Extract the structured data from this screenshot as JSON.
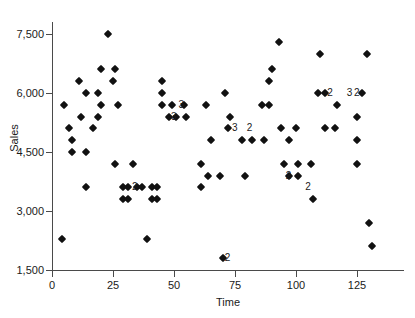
{
  "chart_data": {
    "type": "scatter",
    "title": "",
    "xlabel": "Time",
    "ylabel": "Sales",
    "xlim": [
      0,
      140
    ],
    "ylim": [
      1500,
      7800
    ],
    "grid": false,
    "legend": null,
    "xticks": [
      0,
      25,
      50,
      75,
      100,
      125
    ],
    "xticklabels": [
      "0",
      "25",
      "50",
      "75",
      "100",
      "125"
    ],
    "yticks": [
      1500,
      3000,
      4500,
      6000,
      7500
    ],
    "yticklabels": [
      "1,500",
      "3,000",
      "4,500",
      "6,000",
      "7,500"
    ],
    "marker": "diamond",
    "marker_color": "#111111",
    "points": [
      {
        "x": 4,
        "y": 2300
      },
      {
        "x": 5,
        "y": 5700
      },
      {
        "x": 7,
        "y": 5100
      },
      {
        "x": 8,
        "y": 4800
      },
      {
        "x": 8,
        "y": 4500
      },
      {
        "x": 11,
        "y": 6300
      },
      {
        "x": 12,
        "y": 5400
      },
      {
        "x": 14,
        "y": 6000
      },
      {
        "x": 14,
        "y": 4500
      },
      {
        "x": 14,
        "y": 3600
      },
      {
        "x": 17,
        "y": 5100
      },
      {
        "x": 19,
        "y": 6000
      },
      {
        "x": 19,
        "y": 5400
      },
      {
        "x": 20,
        "y": 6600
      },
      {
        "x": 20,
        "y": 5700
      },
      {
        "x": 23,
        "y": 7500
      },
      {
        "x": 25,
        "y": 6300
      },
      {
        "x": 26,
        "y": 6600
      },
      {
        "x": 26,
        "y": 4200
      },
      {
        "x": 27,
        "y": 5700
      },
      {
        "x": 29,
        "y": 3600
      },
      {
        "x": 29,
        "y": 3300
      },
      {
        "x": 31,
        "y": 3600
      },
      {
        "x": 31,
        "y": 3300
      },
      {
        "x": 33,
        "y": 4200
      },
      {
        "x": 35,
        "y": 3600
      },
      {
        "x": 37,
        "y": 3600
      },
      {
        "x": 39,
        "y": 2300
      },
      {
        "x": 41,
        "y": 3600
      },
      {
        "x": 41,
        "y": 3300
      },
      {
        "x": 43,
        "y": 3600
      },
      {
        "x": 43,
        "y": 3300
      },
      {
        "x": 45,
        "y": 6300
      },
      {
        "x": 45,
        "y": 6000
      },
      {
        "x": 45,
        "y": 5700
      },
      {
        "x": 48,
        "y": 5400
      },
      {
        "x": 49,
        "y": 5700
      },
      {
        "x": 51,
        "y": 5400
      },
      {
        "x": 54,
        "y": 5700
      },
      {
        "x": 55,
        "y": 5400
      },
      {
        "x": 61,
        "y": 4200
      },
      {
        "x": 61,
        "y": 3600
      },
      {
        "x": 63,
        "y": 5700
      },
      {
        "x": 64,
        "y": 3900
      },
      {
        "x": 65,
        "y": 4800
      },
      {
        "x": 69,
        "y": 3900
      },
      {
        "x": 70,
        "y": 1800
      },
      {
        "x": 71,
        "y": 6000
      },
      {
        "x": 72,
        "y": 5100
      },
      {
        "x": 73,
        "y": 5400
      },
      {
        "x": 78,
        "y": 4800
      },
      {
        "x": 79,
        "y": 3900
      },
      {
        "x": 82,
        "y": 4800
      },
      {
        "x": 86,
        "y": 5700
      },
      {
        "x": 87,
        "y": 4800
      },
      {
        "x": 89,
        "y": 5700
      },
      {
        "x": 89,
        "y": 6300
      },
      {
        "x": 90,
        "y": 6600
      },
      {
        "x": 93,
        "y": 7300
      },
      {
        "x": 94,
        "y": 5100
      },
      {
        "x": 95,
        "y": 4200
      },
      {
        "x": 97,
        "y": 4800
      },
      {
        "x": 97,
        "y": 3900
      },
      {
        "x": 100,
        "y": 5100
      },
      {
        "x": 101,
        "y": 4200
      },
      {
        "x": 101,
        "y": 3900
      },
      {
        "x": 106,
        "y": 4200
      },
      {
        "x": 107,
        "y": 3300
      },
      {
        "x": 109,
        "y": 6000
      },
      {
        "x": 110,
        "y": 7000
      },
      {
        "x": 112,
        "y": 6000
      },
      {
        "x": 112,
        "y": 5100
      },
      {
        "x": 116,
        "y": 5100
      },
      {
        "x": 117,
        "y": 5700
      },
      {
        "x": 125,
        "y": 5400
      },
      {
        "x": 125,
        "y": 4800
      },
      {
        "x": 125,
        "y": 4200
      },
      {
        "x": 127,
        "y": 6000
      },
      {
        "x": 129,
        "y": 7000
      },
      {
        "x": 130,
        "y": 2700
      },
      {
        "x": 131,
        "y": 2100
      }
    ],
    "overlap_labels": [
      {
        "x": 32,
        "y": 3600,
        "label": "2"
      },
      {
        "x": 48,
        "y": 5400,
        "label": "3"
      },
      {
        "x": 51,
        "y": 5700,
        "label": "3"
      },
      {
        "x": 73,
        "y": 5100,
        "label": "3"
      },
      {
        "x": 79,
        "y": 5100,
        "label": "2"
      },
      {
        "x": 70,
        "y": 1800,
        "label": "2"
      },
      {
        "x": 95,
        "y": 3900,
        "label": "2"
      },
      {
        "x": 103,
        "y": 3600,
        "label": "2"
      },
      {
        "x": 112,
        "y": 6000,
        "label": "2"
      },
      {
        "x": 120,
        "y": 6000,
        "label": "3"
      },
      {
        "x": 123,
        "y": 6000,
        "label": "2"
      }
    ]
  }
}
